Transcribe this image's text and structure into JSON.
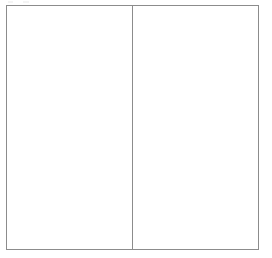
{
  "document": {
    "kind": "scanned-form-page",
    "background_color": "#ffffff",
    "page_width": 272,
    "page_height": 258
  },
  "form_box": {
    "name": "two-column-form-outline",
    "border_color": "#8c8c8c",
    "border_width_px": 1,
    "left_px": 6,
    "top_px": 5,
    "width_px": 253,
    "height_px": 245,
    "fill_color": "#ffffff"
  },
  "divider": {
    "name": "vertical-column-divider",
    "orientation": "vertical",
    "x_px": 132,
    "color": "#8c8c8c",
    "width_px": 1,
    "spans_full_height": true
  },
  "panels": [
    {
      "id": "left",
      "label": "",
      "text": "",
      "width_px": 125,
      "empty": true
    },
    {
      "id": "right",
      "label": "",
      "text": "",
      "width_px": 126,
      "empty": true
    }
  ],
  "artifacts": [
    {
      "id": "speck-top-left-1",
      "x_px": 8,
      "y_px": 1,
      "color": "#f4f4f4"
    },
    {
      "id": "speck-top-left-2",
      "x_px": 23,
      "y_px": 1,
      "color": "#f4f4f4"
    },
    {
      "id": "smudge-upper-right",
      "x_px": 178,
      "y_px": 54,
      "color": "#fafafa"
    }
  ]
}
